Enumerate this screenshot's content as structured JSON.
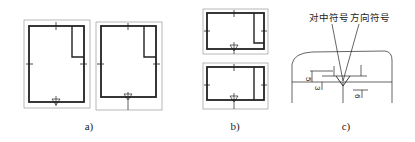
{
  "figure": {
    "panels": [
      {
        "id": "a",
        "label": "a)",
        "description": "Two portrait drawing sheets with title block and centering/orientation marks"
      },
      {
        "id": "b",
        "label": "b)",
        "description": "Two landscape drawing sheets with title block and centering/orientation marks"
      },
      {
        "id": "c",
        "label": "c)",
        "description": "Detail of centering mark and orientation mark with dimensions"
      }
    ],
    "detail": {
      "centering_symbol_label": "对中符号",
      "orientation_symbol_label": "方向符号",
      "dim_5": "5",
      "dim_3": "3",
      "dim_6": "6"
    }
  }
}
